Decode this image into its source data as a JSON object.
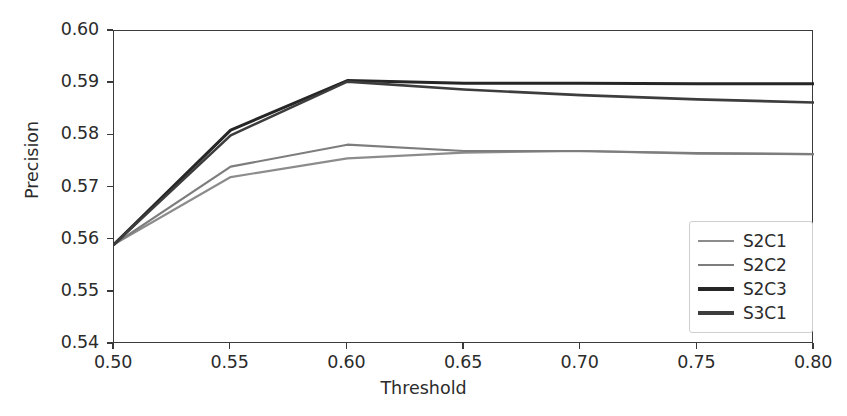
{
  "chart_data": {
    "type": "line",
    "title": "",
    "xlabel": "Threshold",
    "ylabel": "Precision",
    "xlim": [
      0.5,
      0.8
    ],
    "ylim": [
      0.54,
      0.6
    ],
    "xticks": [
      "0.50",
      "0.55",
      "0.60",
      "0.65",
      "0.70",
      "0.75",
      "0.80"
    ],
    "yticks": [
      "0.54",
      "0.55",
      "0.56",
      "0.57",
      "0.58",
      "0.59",
      "0.60"
    ],
    "grid": false,
    "legend_position": "lower right",
    "x": [
      0.5,
      0.55,
      0.6,
      0.65,
      0.7,
      0.75,
      0.8
    ],
    "series": [
      {
        "name": "S2C1",
        "color": "#8c8c8c",
        "width": 2.2,
        "values": [
          0.5591,
          0.572,
          0.5756,
          0.5767,
          0.577,
          0.5765,
          0.5764
        ]
      },
      {
        "name": "S2C2",
        "color": "#7d7d7d",
        "width": 2.2,
        "values": [
          0.5591,
          0.574,
          0.5782,
          0.577,
          0.577,
          0.5766,
          0.5764
        ]
      },
      {
        "name": "S2C3",
        "color": "#262626",
        "width": 3.0,
        "values": [
          0.5591,
          0.581,
          0.5905,
          0.59,
          0.59,
          0.5899,
          0.5899
        ]
      },
      {
        "name": "S3C1",
        "color": "#3d3d3d",
        "width": 2.6,
        "values": [
          0.5591,
          0.58,
          0.5903,
          0.5888,
          0.5877,
          0.5869,
          0.5863
        ]
      }
    ]
  },
  "axes": {
    "xlabel": "Threshold",
    "ylabel": "Precision"
  },
  "legend": {
    "items": [
      {
        "label": "S2C1"
      },
      {
        "label": "S2C2"
      },
      {
        "label": "S2C3"
      },
      {
        "label": "S3C1"
      }
    ]
  }
}
